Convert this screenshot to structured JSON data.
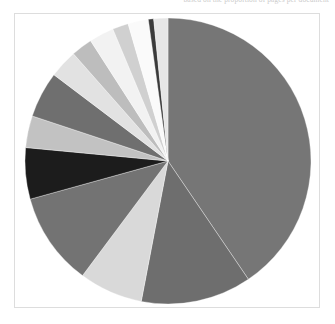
{
  "header": {
    "clipped_text": "based on the proportion of pages per document"
  },
  "figure": {
    "frame_color": "#dddddd",
    "background_color": "#ffffff"
  },
  "chart_data": {
    "type": "pie",
    "title": "",
    "subtitle": "",
    "xlabel": "",
    "ylabel": "",
    "grid": false,
    "legend": "none",
    "start_angle_deg": -90,
    "direction": "clockwise",
    "center": {
      "x": 168,
      "y": 161
    },
    "radius": 143,
    "categories": [
      "Segment 1",
      "Segment 2",
      "Segment 3",
      "Segment 4",
      "Segment 5",
      "Segment 6",
      "Segment 7",
      "Segment 8",
      "Segment 9",
      "Segment 10",
      "Segment 11",
      "Segment 12",
      "Segment 13",
      "Segment 14"
    ],
    "values": [
      40.5,
      12.5,
      7.2,
      10.5,
      5.8,
      3.6,
      5.2,
      3.2,
      2.4,
      2.8,
      1.8,
      2.3,
      0.6,
      1.6
    ],
    "colors": [
      "#767676",
      "#6e6e6e",
      "#d9d9d9",
      "#737373",
      "#1c1c1c",
      "#c2c2c2",
      "#6f6f6f",
      "#e2e2e2",
      "#bdbdbd",
      "#f2f2f2",
      "#d0d0d0",
      "#fafafa",
      "#3a3a3a",
      "#e6e6e6"
    ],
    "slice_stroke": "#ffffff",
    "total": 100
  }
}
